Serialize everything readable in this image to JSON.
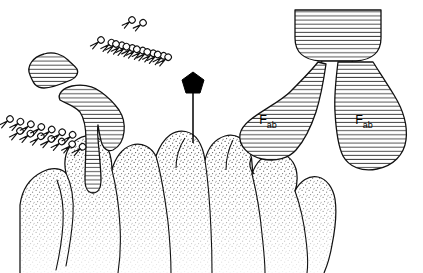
{
  "figure": {
    "type": "biological-line-drawing",
    "background_color": "#ffffff",
    "ink_color": "#000000",
    "hatch_color": "#3a3a3a",
    "stipple_color": "#5a5a5a"
  },
  "labels": {
    "fab_left": {
      "base": "F",
      "subscript": "ab"
    },
    "fab_right": {
      "base": "F",
      "subscript": "ab"
    }
  },
  "structures": {
    "antibody_right": {
      "name": "immunoglobulin",
      "fc_region": "Fc stem (bowl shape, horizontal hatching)",
      "fab_arms": 2,
      "fill_pattern": "horizontal-hatch"
    },
    "antibody_left": {
      "name": "bound antibody fragment",
      "fill_pattern": "horizontal-hatch"
    },
    "antigen_marker": {
      "name": "antigen",
      "shape": "pentagon",
      "color": "#000000",
      "stalk": true
    },
    "cell_surface": {
      "name": "cell membrane with microvilli",
      "fill_pattern": "stipple"
    },
    "lipids": {
      "name": "membrane lipid molecules",
      "shape": "circular head with two tails",
      "row_count": 2
    }
  }
}
